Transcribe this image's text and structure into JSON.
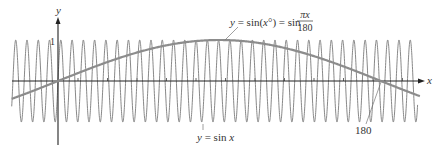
{
  "chart_data": {
    "type": "line",
    "title": "",
    "xlabel": "x",
    "ylabel": "y",
    "xlim": [
      -26,
      200
    ],
    "ylim": [
      -1,
      1
    ],
    "y_tick_labels": [
      "1"
    ],
    "x_annotations": [
      "180"
    ],
    "series": [
      {
        "name": "y = sin x",
        "expression": "sin(x)",
        "color": "#7a7a7a",
        "stroke_width": 0.9,
        "x_range": [
          -25.8,
          200.5
        ]
      },
      {
        "name": "y = sin(x°) = sin πx/180",
        "expression": "sin(pi*x/180)",
        "color": "#8c8c8c",
        "stroke_width": 2.2,
        "x_range": [
          -25.8,
          201.9
        ],
        "zero_crossing_labeled": 180
      }
    ],
    "labels": {
      "y_axis": "y",
      "x_axis": "x",
      "y_one": "1",
      "slow_curve_lhs": "y = sin(x°) = sin",
      "slow_curve_frac_num": "πx",
      "slow_curve_frac_den": "180",
      "fast_curve": "y = sin x",
      "crossing": "180"
    },
    "geometry": {
      "origin_px": [
        58,
        81
      ],
      "px_per_unit_x": 1.794,
      "px_per_unit_y": 41
    }
  }
}
